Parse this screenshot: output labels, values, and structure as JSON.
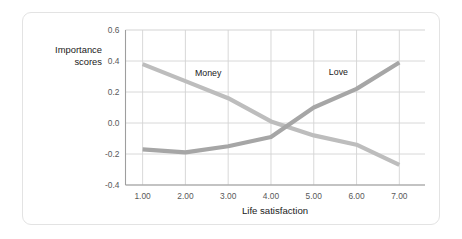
{
  "figure": {
    "background_color": "#ffffff",
    "frame_border_color": "#e3e3e3"
  },
  "chart_data": {
    "type": "line",
    "title": "",
    "xlabel": "Life satisfaction",
    "ylabel": "Importance scores",
    "x": [
      1,
      2,
      3,
      4,
      5,
      6,
      7
    ],
    "xtick_labels": [
      "1.00",
      "2.00",
      "3.00",
      "4.00",
      "5.00",
      "6.00",
      "7.00"
    ],
    "ytick_labels": [
      "0.6",
      "0.4",
      "0.2",
      "0.0",
      "-0.2",
      "-0.4"
    ],
    "ytick_values": [
      0.6,
      0.4,
      0.2,
      0.0,
      -0.2,
      -0.4
    ],
    "xlim": [
      0.6,
      7.6
    ],
    "ylim": [
      -0.4,
      0.6
    ],
    "grid": true,
    "legend_position": "inline-annotation",
    "series": [
      {
        "name": "Money",
        "color": "#bdbdbd",
        "line_width": 4.2,
        "values": [
          0.38,
          0.27,
          0.16,
          0.01,
          -0.08,
          -0.14,
          -0.27
        ],
        "label_x": 2.55,
        "label_y": 0.315
      },
      {
        "name": "Love",
        "color": "#a6a6a6",
        "line_width": 4.2,
        "values": [
          -0.17,
          -0.19,
          -0.15,
          -0.09,
          0.1,
          0.22,
          0.39
        ],
        "label_x": 5.68,
        "label_y": 0.325
      }
    ]
  },
  "annotations": {
    "money_label": "Money",
    "love_label": "Love"
  },
  "axes": {
    "y_title": "Importance\nscores",
    "x_title": "Life satisfaction",
    "axis_line_color": "#9e9e9e",
    "grid_color": "#d4d4d4",
    "tick_text_color": "#595959"
  }
}
